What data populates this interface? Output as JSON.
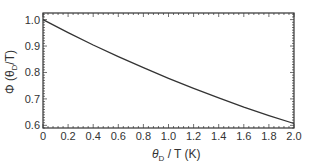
{
  "chart_data": {
    "type": "line",
    "title": "",
    "xlabel": "θD / T (K)",
    "ylabel": "Φ (θD / T)",
    "xlim": [
      0,
      2.0
    ],
    "ylim": [
      0.59,
      1.025
    ],
    "grid": false,
    "legend": null,
    "x_ticks": [
      "0",
      "0.2",
      "0.4",
      "0.6",
      "0.8",
      "1.0",
      "1.2",
      "1.4",
      "1.6",
      "1.8",
      "2.0"
    ],
    "y_ticks": [
      "0.6",
      "0.7",
      "0.8",
      "0.9",
      "1.0"
    ],
    "series": [
      {
        "name": "Φ(θD/T)",
        "x": [
          0,
          0.2,
          0.4,
          0.6,
          0.8,
          1.0,
          1.2,
          1.4,
          1.6,
          1.8,
          2.0
        ],
        "values": [
          1.0,
          0.951,
          0.904,
          0.86,
          0.818,
          0.778,
          0.74,
          0.704,
          0.669,
          0.637,
          0.607
        ]
      }
    ]
  },
  "labels": {
    "x_axis": "θ",
    "x_axis_sub": "D",
    "x_axis_rest": " / T (K)",
    "y_axis_phi": "Φ (θ",
    "y_axis_sub": "D",
    "y_axis_rest": "/T)"
  }
}
